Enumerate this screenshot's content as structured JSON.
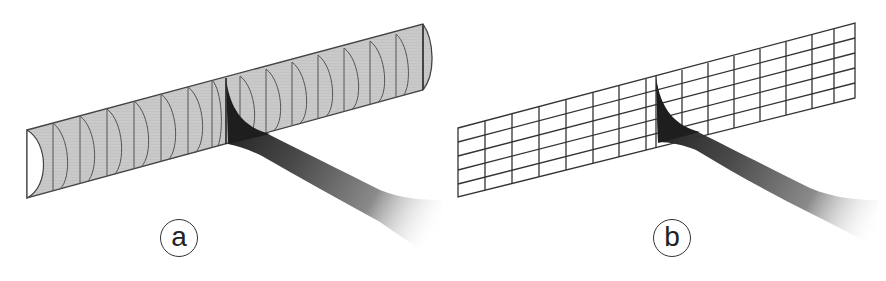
{
  "figure": {
    "panels": [
      {
        "id": "a",
        "label": "a",
        "description": "Half-cylinder tube surface mesh with wake sheet",
        "surface_type": "curved-tube",
        "surface_fill": "#c8c8c8",
        "line_color": "#555555",
        "wake_color": "#2a2a2a"
      },
      {
        "id": "b",
        "label": "b",
        "description": "Flat rectangular grid panel with wake sheet",
        "surface_type": "flat-grid",
        "grid_rows": 5,
        "grid_columns": 15,
        "line_color": "#333333",
        "wake_color": "#2a2a2a"
      }
    ]
  }
}
